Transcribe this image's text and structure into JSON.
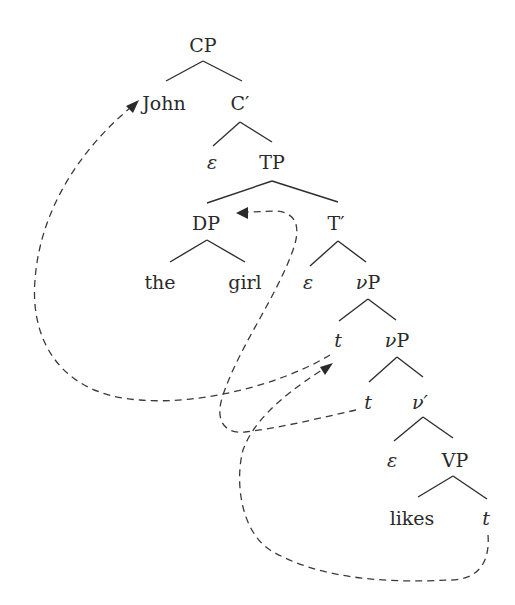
{
  "diagram": {
    "type": "syntax-tree",
    "nodes": [
      {
        "id": "cp",
        "label": "CP",
        "x": 203,
        "y": 45,
        "italic": false
      },
      {
        "id": "john",
        "label": "John",
        "x": 164,
        "y": 103,
        "italic": false
      },
      {
        "id": "cbar",
        "label": "C′",
        "x": 240,
        "y": 103,
        "italic": false
      },
      {
        "id": "eps1",
        "label": "ε",
        "x": 212,
        "y": 162,
        "italic": true
      },
      {
        "id": "tp",
        "label": "TP",
        "x": 272,
        "y": 162,
        "italic": false
      },
      {
        "id": "dp",
        "label": "DP",
        "x": 206,
        "y": 223,
        "italic": false
      },
      {
        "id": "tbar",
        "label": "T′",
        "x": 336,
        "y": 223,
        "italic": false
      },
      {
        "id": "the",
        "label": "the",
        "x": 160,
        "y": 282,
        "italic": false
      },
      {
        "id": "girl",
        "label": "girl",
        "x": 245,
        "y": 282,
        "italic": false
      },
      {
        "id": "eps2",
        "label": "ε",
        "x": 308,
        "y": 282,
        "italic": true
      },
      {
        "id": "vp1",
        "label": "νP",
        "x": 368,
        "y": 282,
        "italic": false
      },
      {
        "id": "t1",
        "label": "t",
        "x": 338,
        "y": 340,
        "italic": true
      },
      {
        "id": "vp2",
        "label": "νP",
        "x": 397,
        "y": 340,
        "italic": false
      },
      {
        "id": "t2",
        "label": "t",
        "x": 368,
        "y": 402,
        "italic": true
      },
      {
        "id": "vbar",
        "label": "ν′",
        "x": 418,
        "y": 402,
        "italic": true
      },
      {
        "id": "eps3",
        "label": "ε",
        "x": 392,
        "y": 460,
        "italic": true
      },
      {
        "id": "vP",
        "label": "VP",
        "x": 455,
        "y": 460,
        "italic": false
      },
      {
        "id": "likes",
        "label": "likes",
        "x": 412,
        "y": 518,
        "italic": false
      },
      {
        "id": "t3",
        "label": "t",
        "x": 486,
        "y": 518,
        "italic": true
      }
    ],
    "edges": [
      [
        "cp",
        "john"
      ],
      [
        "cp",
        "cbar"
      ],
      [
        "cbar",
        "eps1"
      ],
      [
        "cbar",
        "tp"
      ],
      [
        "tp",
        "dp"
      ],
      [
        "tp",
        "tbar"
      ],
      [
        "dp",
        "the"
      ],
      [
        "dp",
        "girl"
      ],
      [
        "tbar",
        "eps2"
      ],
      [
        "tbar",
        "vp1"
      ],
      [
        "vp1",
        "t1"
      ],
      [
        "vp1",
        "vp2"
      ],
      [
        "vp2",
        "t2"
      ],
      [
        "vp2",
        "vbar"
      ],
      [
        "vbar",
        "eps3"
      ],
      [
        "vbar",
        "vP"
      ],
      [
        "vP",
        "likes"
      ],
      [
        "vP",
        "t3"
      ]
    ],
    "movement_arrows": [
      {
        "from": "t1",
        "to": "john",
        "style": "dashed"
      },
      {
        "from": "t2",
        "to": "dp",
        "style": "dashed"
      },
      {
        "from": "t3",
        "to": "t1",
        "style": "dashed"
      }
    ]
  }
}
